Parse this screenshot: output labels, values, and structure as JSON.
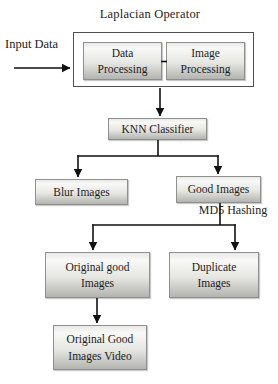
{
  "diagram": {
    "title": "Laplacian Operator",
    "labels": {
      "input": "Input Data",
      "md5": "MD5 Hashing"
    },
    "nodes": {
      "data_processing": {
        "label": "Data\nProcessing"
      },
      "image_processing": {
        "label": "Image\nProcessing"
      },
      "knn_classifier": {
        "label": "KNN Classifier"
      },
      "blur_images": {
        "label": "Blur Images"
      },
      "good_images": {
        "label": "Good Images"
      },
      "original_good_images": {
        "label": "Original good\nImages"
      },
      "duplicate_images": {
        "label": "Duplicate\nImages"
      },
      "original_good_images_video": {
        "label": "Original Good\nImages Video"
      }
    },
    "edges": [
      {
        "from": "Input Data",
        "to": "Data Processing / Image Processing"
      },
      {
        "from": "Data Processing",
        "to": "Image Processing"
      },
      {
        "from": "Laplacian Operator block",
        "to": "KNN Classifier"
      },
      {
        "from": "KNN Classifier",
        "to": "Blur Images"
      },
      {
        "from": "KNN Classifier",
        "to": "Good Images"
      },
      {
        "from": "Good Images (MD5 Hashing)",
        "to": "Original good Images"
      },
      {
        "from": "Good Images (MD5 Hashing)",
        "to": "Duplicate Images"
      },
      {
        "from": "Original good Images",
        "to": "Original Good Images Video"
      }
    ],
    "colors": {
      "box-border": "#8f8f8f",
      "box-fill-top": "#e9e9e7",
      "box-fill-hi": "#f8f8f6",
      "box-fill-mid": "#e6e6e3",
      "box-fill-bottom": "#b3b3b0",
      "outer-border": "#4f4f4f",
      "wire": "#111111",
      "text": "#1c1c1c",
      "background": "#ffffff"
    }
  }
}
